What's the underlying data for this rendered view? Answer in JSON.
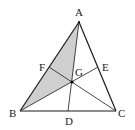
{
  "diagram": {
    "type": "triangle-with-medians",
    "points": {
      "A": {
        "label": "A"
      },
      "B": {
        "label": "B"
      },
      "C": {
        "label": "C"
      },
      "D": {
        "label": "D"
      },
      "E": {
        "label": "E"
      },
      "F": {
        "label": "F"
      },
      "G": {
        "label": "G"
      }
    },
    "segments": [
      "AB",
      "BC",
      "CA",
      "AD",
      "BE",
      "CF"
    ],
    "shaded_region": "ABG",
    "colors": {
      "shade": "#cfcfcf",
      "line": "#1a1a1a",
      "point": "#000000"
    }
  }
}
